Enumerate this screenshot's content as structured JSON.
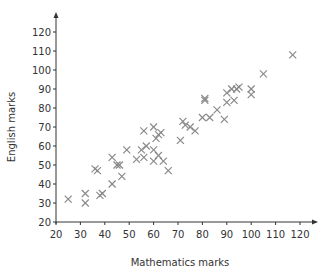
{
  "chart_data": {
    "type": "scatter",
    "title": "",
    "xlabel": "Mathematics marks",
    "ylabel": "English marks",
    "xlim": [
      20,
      120
    ],
    "ylim": [
      20,
      120
    ],
    "xticks": [
      20,
      30,
      40,
      50,
      60,
      70,
      80,
      90,
      100,
      110,
      120
    ],
    "yticks": [
      20,
      30,
      40,
      50,
      60,
      70,
      80,
      90,
      100,
      110,
      120
    ],
    "grid": false,
    "legend": null,
    "marker": "x",
    "marker_color": "#8a8a8a",
    "axis_color": "#333333",
    "series": [
      {
        "name": "students",
        "points": [
          [
            25,
            32
          ],
          [
            32,
            30
          ],
          [
            32,
            35
          ],
          [
            36,
            48
          ],
          [
            37,
            47
          ],
          [
            38,
            34
          ],
          [
            39,
            35
          ],
          [
            43,
            54
          ],
          [
            43,
            40
          ],
          [
            45,
            50
          ],
          [
            46,
            50
          ],
          [
            47,
            44
          ],
          [
            49,
            58
          ],
          [
            53,
            53
          ],
          [
            55,
            58
          ],
          [
            56,
            68
          ],
          [
            56,
            54
          ],
          [
            57,
            60
          ],
          [
            60,
            70
          ],
          [
            60,
            58
          ],
          [
            60,
            52
          ],
          [
            61,
            64
          ],
          [
            62,
            66
          ],
          [
            62,
            55
          ],
          [
            63,
            67
          ],
          [
            64,
            52
          ],
          [
            66,
            47
          ],
          [
            71,
            63
          ],
          [
            72,
            73
          ],
          [
            73,
            71
          ],
          [
            75,
            70
          ],
          [
            77,
            68
          ],
          [
            80,
            75
          ],
          [
            81,
            84
          ],
          [
            81,
            85
          ],
          [
            83,
            75
          ],
          [
            86,
            79
          ],
          [
            89,
            74
          ],
          [
            90,
            88
          ],
          [
            90,
            83
          ],
          [
            92,
            90
          ],
          [
            93,
            84
          ],
          [
            94,
            90
          ],
          [
            95,
            91
          ],
          [
            100,
            87
          ],
          [
            100,
            90
          ],
          [
            105,
            98
          ],
          [
            117,
            108
          ]
        ]
      }
    ]
  }
}
